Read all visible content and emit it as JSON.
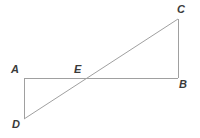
{
  "figure": {
    "background_color": "#ffffff",
    "stroke_color": "#a0a0a0",
    "label_color": "#3a3a3a",
    "stroke_width": 1,
    "canvas": {
      "width": 200,
      "height": 138
    },
    "points": {
      "A": {
        "label": "A",
        "x": 24,
        "y": 78
      },
      "B": {
        "label": "B",
        "x": 178,
        "y": 78
      },
      "C": {
        "label": "C",
        "x": 178,
        "y": 19
      },
      "D": {
        "label": "D",
        "x": 24,
        "y": 119
      },
      "E": {
        "label": "E",
        "x": 85,
        "y": 78
      }
    },
    "segments": [
      {
        "name": "segment-AB",
        "from": "A",
        "to": "B",
        "x1": 24,
        "y1": 78,
        "x2": 178,
        "y2": 78
      },
      {
        "name": "segment-AD",
        "from": "A",
        "to": "D",
        "x1": 24,
        "y1": 78,
        "x2": 24,
        "y2": 119
      },
      {
        "name": "segment-BC",
        "from": "B",
        "to": "C",
        "x1": 178,
        "y1": 78,
        "x2": 178,
        "y2": 19
      },
      {
        "name": "segment-DC",
        "from": "D",
        "to": "C",
        "x1": 24,
        "y1": 119,
        "x2": 178,
        "y2": 19
      }
    ],
    "labels": {
      "A": "A",
      "B": "B",
      "C": "C",
      "D": "D",
      "E": "E"
    }
  }
}
